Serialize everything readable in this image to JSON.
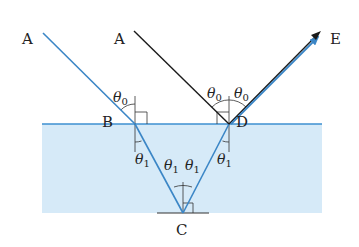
{
  "diagram": {
    "type": "reflection-refraction",
    "colors": {
      "water_fill": "#d6eaf8",
      "surface_line": "#3c8fd0",
      "ray_blue": "#3b86c6",
      "ray_black": "#1a1a1a",
      "guide_line": "#333333",
      "arrow_head": "#3b86c6"
    },
    "points": {
      "A_left": "A",
      "A_right": "A",
      "B": "B",
      "C": "C",
      "D": "D",
      "E": "E"
    },
    "angles": {
      "theta0_incident_B": "θ",
      "theta0_incident_B_sub": "0",
      "theta0_incident_D": "θ",
      "theta0_incident_D_sub": "0",
      "theta0_reflect_D": "θ",
      "theta0_reflect_D_sub": "0",
      "theta1_refract_B": "θ",
      "theta1_refract_B_sub": "1",
      "theta1_C_left": "θ",
      "theta1_C_left_sub": "1",
      "theta1_C_right": "θ",
      "theta1_C_right_sub": "1",
      "theta1_refract_D": "θ",
      "theta1_refract_D_sub": "1"
    }
  }
}
